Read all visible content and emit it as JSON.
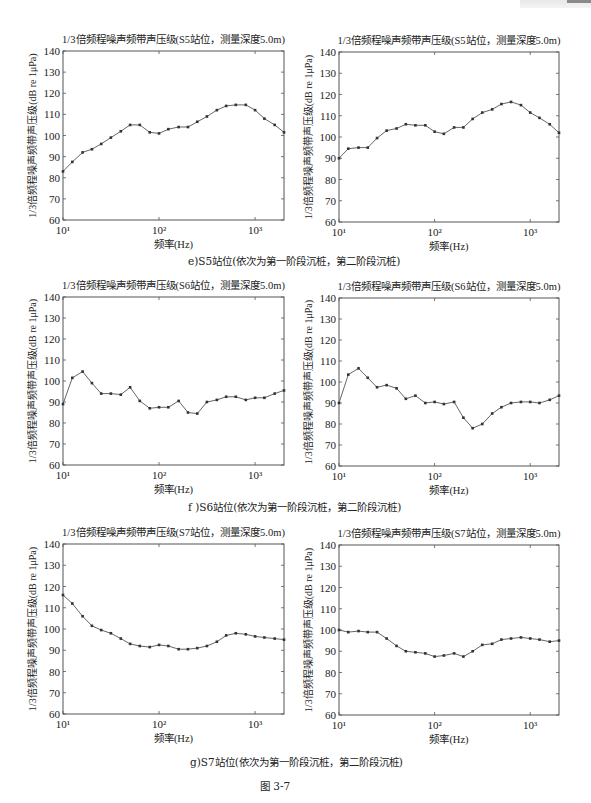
{
  "figure": {
    "label": "图   3-7",
    "captions": [
      "e)S5站位(依次为第一阶段沉桩，第二阶段沉桩)",
      "f )S6站位(依次为第一阶段沉桩，第二阶段沉桩)",
      "g)S7站位(依次为第一阶段沉桩，第二阶段沉桩)"
    ]
  },
  "chart_data": [
    {
      "type": "line",
      "title": "1/3倍频程噪声频带声压级(S5站位，测量深度5.0m)",
      "xlabel": "频率(Hz)",
      "ylabel": "1/3倍频程噪声频带声压级(dB re 1μPa)",
      "xscale": "log",
      "xlim": [
        10,
        2000
      ],
      "ylim": [
        60,
        140
      ],
      "yticks": [
        60,
        70,
        80,
        90,
        100,
        110,
        120,
        130,
        140
      ],
      "xticks": [
        "10¹",
        "10²",
        "10³"
      ],
      "grid": false,
      "x": [
        10,
        12.5,
        16,
        20,
        25,
        31.5,
        40,
        50,
        63,
        80,
        100,
        125,
        160,
        200,
        250,
        315,
        400,
        500,
        630,
        800,
        1000,
        1250,
        1600,
        2000
      ],
      "values": [
        83,
        87.5,
        92,
        93.5,
        96,
        99,
        102,
        105,
        105,
        101.5,
        101,
        103,
        104,
        104,
        106.5,
        109,
        112,
        114,
        114.5,
        114.5,
        112,
        108,
        105,
        101.5
      ],
      "panel": "S5 stage 1"
    },
    {
      "type": "line",
      "title": "1/3倍频程噪声频带声压级(S5站位，测量深度5.0m)",
      "xlabel": "频率(Hz)",
      "ylabel": "1/3倍频程噪声频带声压级(dB re 1μPa)",
      "xscale": "log",
      "xlim": [
        10,
        2000
      ],
      "ylim": [
        60,
        140
      ],
      "yticks": [
        60,
        70,
        80,
        90,
        100,
        110,
        120,
        130,
        140
      ],
      "xticks": [
        "10¹",
        "10²",
        "10³"
      ],
      "grid": false,
      "x": [
        10,
        12.5,
        16,
        20,
        25,
        31.5,
        40,
        50,
        63,
        80,
        100,
        125,
        160,
        200,
        250,
        315,
        400,
        500,
        630,
        800,
        1000,
        1250,
        1600,
        2000
      ],
      "values": [
        90,
        94.5,
        95,
        95,
        99.5,
        103,
        104,
        106,
        105.5,
        105.5,
        102.5,
        101.5,
        104.5,
        104.5,
        108.5,
        111.5,
        113,
        115.5,
        116.5,
        115,
        111.5,
        109,
        106,
        102
      ],
      "panel": "S5 stage 2"
    },
    {
      "type": "line",
      "title": "1/3倍频程噪声频带声压级(S6站位，测量深度5.0m)",
      "xlabel": "频率(Hz)",
      "ylabel": "1/3倍频程噪声频带声压级(dB re 1μPa)",
      "xscale": "log",
      "xlim": [
        10,
        2000
      ],
      "ylim": [
        60,
        140
      ],
      "yticks": [
        60,
        70,
        80,
        90,
        100,
        110,
        120,
        130,
        140
      ],
      "xticks": [
        "10¹",
        "10²",
        "10³"
      ],
      "grid": false,
      "x": [
        10,
        12.5,
        16,
        20,
        25,
        31.5,
        40,
        50,
        63,
        80,
        100,
        125,
        160,
        200,
        250,
        315,
        400,
        500,
        630,
        800,
        1000,
        1250,
        1600,
        2000
      ],
      "values": [
        89,
        101.5,
        104.5,
        99,
        94,
        94,
        93.5,
        97,
        90.5,
        87,
        87.5,
        87.5,
        90.5,
        85,
        84.5,
        90,
        91,
        92.5,
        92.5,
        91,
        92,
        92,
        94,
        95.5
      ],
      "panel": "S6 stage 1"
    },
    {
      "type": "line",
      "title": "1/3倍频程噪声频带声压级(S6站位，测量深度5.0m)",
      "xlabel": "频率(Hz)",
      "ylabel": "1/3倍频程噪声频带声压级(dB re 1μPa)",
      "xscale": "log",
      "xlim": [
        10,
        2000
      ],
      "ylim": [
        60,
        140
      ],
      "yticks": [
        60,
        70,
        80,
        90,
        100,
        110,
        120,
        130,
        140
      ],
      "xticks": [
        "10¹",
        "10²",
        "10³"
      ],
      "grid": false,
      "x": [
        10,
        12.5,
        16,
        20,
        25,
        31.5,
        40,
        50,
        63,
        80,
        100,
        125,
        160,
        200,
        250,
        315,
        400,
        500,
        630,
        800,
        1000,
        1250,
        1600,
        2000
      ],
      "values": [
        90,
        103.5,
        106.5,
        102,
        97.5,
        98.5,
        97,
        92,
        93.5,
        90,
        90.5,
        89.5,
        90.5,
        83,
        78,
        80,
        85,
        88,
        90,
        90.5,
        90.5,
        90,
        91.5,
        93.5
      ],
      "panel": "S6 stage 2"
    },
    {
      "type": "line",
      "title": "1/3倍频程噪声频带声压级(S7站位，测量深度5.0m)",
      "xlabel": "频率(Hz)",
      "ylabel": "1/3倍频程噪声频带声压级(dB re 1μPa)",
      "xscale": "log",
      "xlim": [
        10,
        2000
      ],
      "ylim": [
        60,
        140
      ],
      "yticks": [
        60,
        70,
        80,
        90,
        100,
        110,
        120,
        130,
        140
      ],
      "xticks": [
        "10¹",
        "10²",
        "10³"
      ],
      "grid": false,
      "x": [
        10,
        12.5,
        16,
        20,
        25,
        31.5,
        40,
        50,
        63,
        80,
        100,
        125,
        160,
        200,
        250,
        315,
        400,
        500,
        630,
        800,
        1000,
        1250,
        1600,
        2000
      ],
      "values": [
        116,
        112,
        106,
        101.5,
        99.5,
        98,
        95.5,
        93,
        92,
        91.5,
        92.5,
        92,
        90.5,
        90.5,
        91,
        92,
        94,
        97,
        98,
        97.5,
        96.5,
        96,
        95.5,
        95
      ],
      "panel": "S7 stage 1"
    },
    {
      "type": "line",
      "title": "1/3倍频程噪声频带声压级(S7站位，测量深度5.0m)",
      "xlabel": "频率(Hz)",
      "ylabel": "1/3倍频程噪声频带声压级(dB re 1μPa)",
      "xscale": "log",
      "xlim": [
        10,
        2000
      ],
      "ylim": [
        60,
        140
      ],
      "yticks": [
        60,
        70,
        80,
        90,
        100,
        110,
        120,
        130,
        140
      ],
      "xticks": [
        "10¹",
        "10²",
        "10³"
      ],
      "grid": false,
      "x": [
        10,
        12.5,
        16,
        20,
        25,
        31.5,
        40,
        50,
        63,
        80,
        100,
        125,
        160,
        200,
        250,
        315,
        400,
        500,
        630,
        800,
        1000,
        1250,
        1600,
        2000
      ],
      "values": [
        100,
        99,
        99.5,
        99,
        99,
        96,
        92.5,
        90,
        89.5,
        89,
        87.5,
        88,
        89,
        87.5,
        90,
        93,
        93.5,
        95.5,
        96,
        96.5,
        96,
        95.5,
        94.5,
        95
      ],
      "panel": "S7 stage 2"
    }
  ]
}
